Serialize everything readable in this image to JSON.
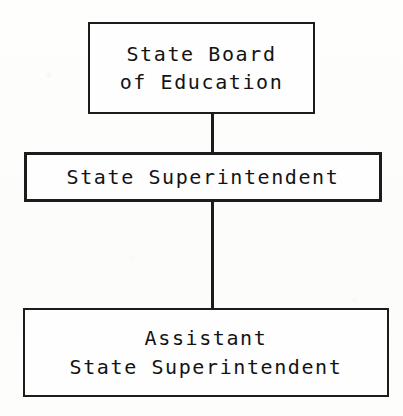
{
  "diagram": {
    "background_color": "#fdfdfc",
    "ink_color": "#1c1c1c",
    "nodes": [
      {
        "id": "state-board-of-education",
        "lines": [
          "State Board",
          "of Education"
        ],
        "level": 1
      },
      {
        "id": "state-superintendent",
        "lines": [
          "State Superintendent"
        ],
        "level": 2
      },
      {
        "id": "assistant-state-superintendent",
        "lines": [
          "Assistant",
          "State Superintendent"
        ],
        "level": 3
      }
    ],
    "connectors": [
      {
        "id": "board-to-superintendent",
        "from": "state-board-of-education",
        "to": "state-superintendent",
        "style": "vertical-line"
      },
      {
        "id": "superintendent-to-assistant",
        "from": "state-superintendent",
        "to": "assistant-state-superintendent",
        "style": "vertical-line"
      }
    ]
  }
}
